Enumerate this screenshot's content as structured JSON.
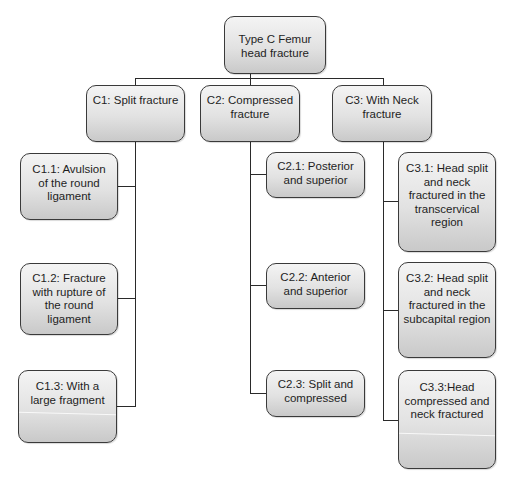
{
  "diagram": {
    "root": {
      "label": "Type C Femur\nhead fracture"
    },
    "categories": [
      {
        "label": "C1: Split fracture",
        "children": [
          {
            "label": "C1.1: Avulsion\nof the round\nligament"
          },
          {
            "label": "C1.2: Fracture\nwith rupture of\nthe round\nligament"
          },
          {
            "label": "C1.3: With a\nlarge fragment"
          }
        ]
      },
      {
        "label": "C2: Compressed\nfracture",
        "children": [
          {
            "label": "C2.1: Posterior\nand superior"
          },
          {
            "label": "C2.2: Anterior\nand superior"
          },
          {
            "label": "C2.3: Split and\ncompressed"
          }
        ]
      },
      {
        "label": "C3: With Neck\nfracture",
        "children": [
          {
            "label": "C3.1: Head split\nand neck\nfractured in the\ntranscervical\nregion"
          },
          {
            "label": "C3.2: Head split\nand neck\nfractured in the\nsubcapital region"
          },
          {
            "label": "C3.3:Head\ncompressed and\nneck fractured"
          }
        ]
      }
    ]
  },
  "colors": {
    "border": "#3a3a3a",
    "connector": "#2a2a2a",
    "fill_top": "#f4f4f4",
    "fill_bottom": "#c9c9c9",
    "text": "#1e1e1e"
  }
}
